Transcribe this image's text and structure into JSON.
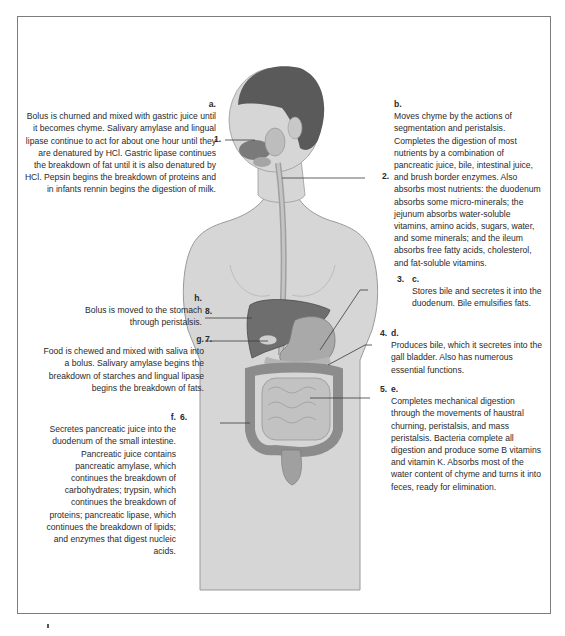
{
  "figure": {
    "type": "labeled anatomical diagram"
  },
  "callouts": [
    {
      "number": "1.",
      "letter": "a.",
      "text": "Bolus is churned and mixed with gastric juice until it becomes chyme. Salivary amylase and lingual lipase continue to act for about one hour until they are denatured by HCl. Gastric lipase continues the breakdown of fat until it is also denatured by HCl. Pepsin begins the breakdown of proteins and in infants rennin begins the digestion of milk.",
      "side": "left"
    },
    {
      "number": "2.",
      "letter": "b.",
      "text": "Moves chyme by the actions of segmentation and peristalsis. Completes the digestion of most nutrients by a combination of pancreatic juice, bile, intestinal juice, and brush border enzymes. Also absorbs most nutrients: the duodenum absorbs some micro-minerals; the jejunum absorbs water-soluble vitamins, amino acids, sugars, water, and some minerals; and the ileum absorbs free fatty acids, cholesterol, and fat-soluble vitamins.",
      "side": "right"
    },
    {
      "number": "3.",
      "letter": "c.",
      "text": "Stores bile and secretes it into the duodenum. Bile emulsifies fats.",
      "side": "right"
    },
    {
      "number": "4.",
      "letter": "d.",
      "text": "Produces bile, which it secretes into the gall bladder. Also has numerous essential functions.",
      "side": "right"
    },
    {
      "number": "5.",
      "letter": "e.",
      "text": "Completes mechanical digestion through the movements of haustral churning, peristalsis, and mass peristalsis. Bacteria complete all digestion and produce some B vitamins and vitamin K. Absorbs most of the water content of chyme and turns it into feces, ready for elimination.",
      "side": "right"
    },
    {
      "number": "6.",
      "letter": "f.",
      "text": "Secretes pancreatic juice into the duodenum of the small intestine. Pancreatic juice contains pancreatic amylase, which continues the breakdown of carbohydrates; trypsin, which continues the breakdown of proteins; pancreatic lipase, which continues the breakdown of lipids; and enzymes that digest nucleic acids.",
      "side": "left"
    },
    {
      "number": "7.",
      "letter": "g.",
      "text": "Food is chewed and mixed with saliva into a bolus. Salivary amylase begins the breakdown of starches and lingual lipase begins the breakdown of fats.",
      "side": "left"
    },
    {
      "number": "8.",
      "letter": "h.",
      "text": "Bolus is moved to the stomach through peristalsis.",
      "side": "left"
    }
  ],
  "colors": {
    "skin": "#d6d6d6",
    "skin_outline": "#9a9a9a",
    "hair": "#5a5a5a",
    "liver": "#6e6e6e",
    "stomach": "#a9a9a9",
    "intestine": "#c2c2c2",
    "colon": "#8c8c8c",
    "leader_line": "#3a3a3a",
    "frame": "#7c7c7c"
  }
}
